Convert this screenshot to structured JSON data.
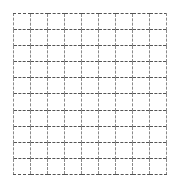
{
  "figure": {
    "title": "",
    "type": "grid",
    "background_color": "#ffffff",
    "border_style": "dashed",
    "horizontal_line_color": "#555555",
    "vertical_line_color": "#8a8a8a",
    "columns": 9,
    "rows": 10,
    "grid_left": 13,
    "grid_top": 13,
    "grid_width": 154,
    "grid_height": 162,
    "cell_width": 17.1,
    "cell_height": 16.2
  },
  "chart_data": {
    "type": "table",
    "title": "",
    "xlabel": "",
    "ylabel": "",
    "grid": true,
    "legend": "none",
    "columns": 9,
    "rows": 10,
    "column_headers": [
      "",
      "",
      "",
      "",
      "",
      "",
      "",
      "",
      ""
    ],
    "cells": [
      [
        "",
        "",
        "",
        "",
        "",
        "",
        "",
        "",
        ""
      ],
      [
        "",
        "",
        "",
        "",
        "",
        "",
        "",
        "",
        ""
      ],
      [
        "",
        "",
        "",
        "",
        "",
        "",
        "",
        "",
        ""
      ],
      [
        "",
        "",
        "",
        "",
        "",
        "",
        "",
        "",
        ""
      ],
      [
        "",
        "",
        "",
        "",
        "",
        "",
        "",
        "",
        ""
      ],
      [
        "",
        "",
        "",
        "",
        "",
        "",
        "",
        "",
        ""
      ],
      [
        "",
        "",
        "",
        "",
        "",
        "",
        "",
        "",
        ""
      ],
      [
        "",
        "",
        "",
        "",
        "",
        "",
        "",
        "",
        ""
      ],
      [
        "",
        "",
        "",
        "",
        "",
        "",
        "",
        "",
        ""
      ],
      [
        "",
        "",
        "",
        "",
        "",
        "",
        "",
        "",
        ""
      ]
    ]
  }
}
